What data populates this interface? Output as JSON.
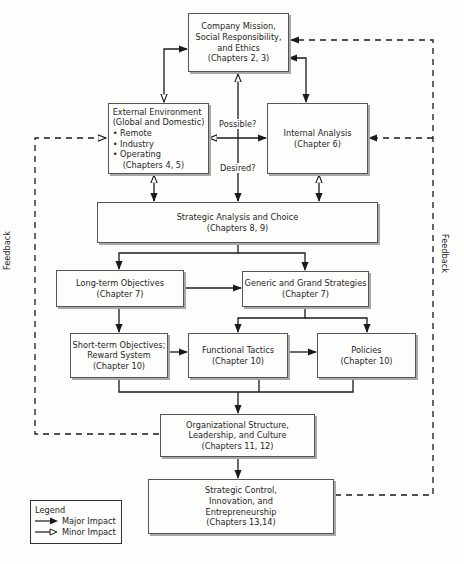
{
  "diagram": {
    "boxes": {
      "mission": {
        "lines": [
          "Company Mission,",
          "Social Responsibility,",
          "and Ethics",
          "(Chapters 2, 3)"
        ]
      },
      "external": {
        "title": [
          "External Environment",
          "(Global and Domestic)"
        ],
        "bullets": [
          "• Remote",
          "• Industry",
          "• Operating"
        ],
        "chapters": "(Chapters 4, 5)"
      },
      "internal": {
        "lines": [
          "Internal Analysis",
          "(Chapter 6)"
        ]
      },
      "strategic_analysis": {
        "lines": [
          "Strategic Analysis and Choice",
          "(Chapters 8, 9)"
        ]
      },
      "long_term": {
        "lines": [
          "Long-term Objectives",
          "(Chapter 7)"
        ]
      },
      "generic": {
        "lines": [
          "Generic and Grand Strategies",
          "(Chapter 7)"
        ]
      },
      "short_term": {
        "lines": [
          "Short-term Objectives;",
          "Reward System",
          "(Chapter 10)"
        ]
      },
      "functional": {
        "lines": [
          "Functional Tactics",
          "(Chapter 10)"
        ]
      },
      "policies": {
        "lines": [
          "Policies",
          "(Chapter 10)"
        ]
      },
      "organizational": {
        "lines": [
          "Organizational Structure,",
          "Leadership, and Culture",
          "(Chapters 11, 12)"
        ]
      },
      "control": {
        "lines": [
          "Strategic Control,",
          "Innovation, and",
          "Entrepreneurship",
          "(Chapters 13,14)"
        ]
      }
    },
    "labels": {
      "possible": "Possible?",
      "desired": "Desired?",
      "feedback_left": "Feedback",
      "feedback_right": "Feedback"
    },
    "legend": {
      "title": "Legend",
      "major": "Major Impact",
      "minor": "Minor Impact"
    },
    "colors": {
      "line": "#1a1a1a",
      "box_border": "#555555",
      "shadow": "#a8a8a8",
      "background": "#fdfdfb"
    }
  }
}
